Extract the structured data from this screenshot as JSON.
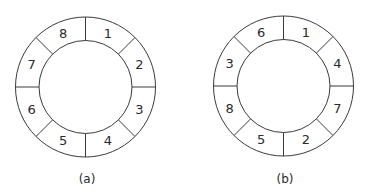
{
  "diagrams": [
    {
      "id": "a",
      "caption": "(a)",
      "center": [
        85.5,
        87
      ],
      "outer_radius": 70,
      "inner_radius": 46.5,
      "segments_clockwise_from_top": [
        "1",
        "2",
        "3",
        "4",
        "5",
        "6",
        "7",
        "8"
      ]
    },
    {
      "id": "b",
      "caption": "(b)",
      "center": [
        283.5,
        86
      ],
      "outer_radius": 70,
      "inner_radius": 46.5,
      "segments_clockwise_from_top": [
        "1",
        "4",
        "7",
        "2",
        "5",
        "8",
        "3",
        "6"
      ]
    }
  ],
  "colors": {
    "stroke": "#3a3a3a",
    "text": "#2a2a2a",
    "background": "#ffffff"
  }
}
